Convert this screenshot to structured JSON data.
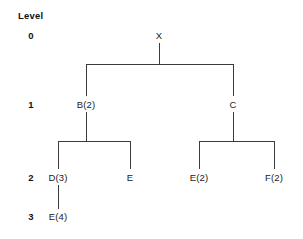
{
  "diagram": {
    "type": "tree",
    "title": "",
    "background_color": "#ffffff",
    "line_color": "#3b3b3b",
    "text_color": "#1a1a1a",
    "axis": {
      "label": "Level",
      "label_x": 18,
      "label_y": 10,
      "levels": [
        {
          "value": "0",
          "x": 31,
          "y": 35
        },
        {
          "value": "1",
          "x": 31,
          "y": 104
        },
        {
          "value": "2",
          "x": 31,
          "y": 177
        },
        {
          "value": "3",
          "x": 31,
          "y": 216
        }
      ]
    },
    "nodes": [
      {
        "id": "X",
        "label": "X",
        "level": 0,
        "x": 159,
        "y": 35
      },
      {
        "id": "B",
        "label": "B(2)",
        "level": 1,
        "x": 86,
        "y": 104
      },
      {
        "id": "C",
        "label": "C",
        "level": 1,
        "x": 233,
        "y": 104
      },
      {
        "id": "D",
        "label": "D(3)",
        "level": 2,
        "x": 58,
        "y": 177
      },
      {
        "id": "E1",
        "label": "E",
        "level": 2,
        "x": 130,
        "y": 177
      },
      {
        "id": "E2",
        "label": "E(2)",
        "level": 2,
        "x": 199,
        "y": 177
      },
      {
        "id": "F",
        "label": "F(2)",
        "level": 2,
        "x": 274,
        "y": 177
      },
      {
        "id": "E4",
        "label": "E(4)",
        "level": 3,
        "x": 58,
        "y": 216
      }
    ],
    "edges": [
      {
        "from": "X",
        "to": "B"
      },
      {
        "from": "X",
        "to": "C"
      },
      {
        "from": "B",
        "to": "D"
      },
      {
        "from": "B",
        "to": "E1"
      },
      {
        "from": "C",
        "to": "E2"
      },
      {
        "from": "C",
        "to": "F"
      },
      {
        "from": "D",
        "to": "E4"
      }
    ],
    "edge_paths": [
      {
        "name": "edge-x-stem",
        "d": "M 159 43 L 159 64"
      },
      {
        "name": "edge-x-bar",
        "d": "M 86 64 L 233 64"
      },
      {
        "name": "edge-to-b",
        "d": "M 86 64 L 86 96"
      },
      {
        "name": "edge-to-c",
        "d": "M 233 64 L 233 96"
      },
      {
        "name": "edge-b-stem",
        "d": "M 86 112 L 86 141"
      },
      {
        "name": "edge-b-bar",
        "d": "M 58 141 L 130 141"
      },
      {
        "name": "edge-to-d",
        "d": "M 58 141 L 58 169"
      },
      {
        "name": "edge-to-e1",
        "d": "M 130 141 L 130 169"
      },
      {
        "name": "edge-c-stem",
        "d": "M 233 112 L 233 141"
      },
      {
        "name": "edge-c-bar",
        "d": "M 199 141 L 274 141"
      },
      {
        "name": "edge-to-e2",
        "d": "M 199 141 L 199 169"
      },
      {
        "name": "edge-to-f",
        "d": "M 274 141 L 274 169"
      },
      {
        "name": "edge-d-to-e4",
        "d": "M 58 185 L 58 209"
      }
    ]
  }
}
